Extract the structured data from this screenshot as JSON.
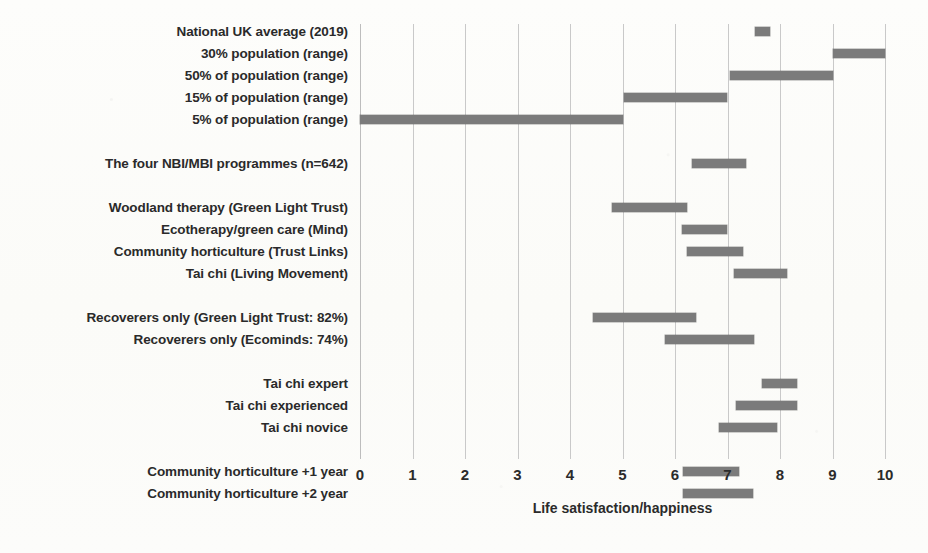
{
  "chart_data": {
    "type": "bar",
    "orientation": "horizontal",
    "style": "range-bars",
    "title": "",
    "xlabel": "Life satisfaction/happiness",
    "ylabel": "",
    "xlim": [
      0,
      10
    ],
    "xticks": [
      0,
      1,
      2,
      3,
      4,
      5,
      6,
      7,
      8,
      9,
      10
    ],
    "xtick_labels": [
      "0",
      "1",
      "2",
      "3",
      "4",
      "5",
      "6",
      "7",
      "8",
      "9",
      "10"
    ],
    "grid": "vertical",
    "legend": "none",
    "bar_color": "#7b7b7b",
    "gridline_color": "#c9c9c9",
    "background_color": "#fdfdfb",
    "groups": [
      {
        "name": "national-benchmarks",
        "rows": [
          {
            "label": "National UK average (2019)",
            "start": 7.52,
            "end": 7.81
          },
          {
            "label": "30% population (range)",
            "start": 9.0,
            "end": 10.0
          },
          {
            "label": "50% of population (range)",
            "start": 7.05,
            "end": 9.0
          },
          {
            "label": "15% of population (range)",
            "start": 5.03,
            "end": 7.0
          },
          {
            "label": "5% of population (range)",
            "start": 0.0,
            "end": 5.0
          }
        ]
      },
      {
        "name": "all-programmes",
        "rows": [
          {
            "label": "The four NBI/MBI programmes (n=642)",
            "start": 6.32,
            "end": 7.35
          }
        ]
      },
      {
        "name": "individual-programmes",
        "rows": [
          {
            "label": "Woodland therapy (Green Light Trust)",
            "start": 4.8,
            "end": 6.22
          },
          {
            "label": "Ecotherapy/green care (Mind)",
            "start": 6.13,
            "end": 7.0
          },
          {
            "label": "Community horticulture (Trust Links)",
            "start": 6.22,
            "end": 7.3
          },
          {
            "label": "Tai chi (Living Movement)",
            "start": 7.12,
            "end": 8.13
          }
        ]
      },
      {
        "name": "recoverers",
        "rows": [
          {
            "label": "Recoverers only (Green Light Trust: 82%)",
            "start": 4.43,
            "end": 6.4
          },
          {
            "label": "Recoverers only (Ecominds: 74%)",
            "start": 5.8,
            "end": 7.5
          }
        ]
      },
      {
        "name": "tai-chi-experience",
        "rows": [
          {
            "label": "Tai chi expert",
            "start": 7.65,
            "end": 8.32
          },
          {
            "label": "Tai chi experienced",
            "start": 7.16,
            "end": 8.32
          },
          {
            "label": "Tai chi novice",
            "start": 6.84,
            "end": 7.95
          }
        ]
      },
      {
        "name": "community-horticulture-followup",
        "rows": [
          {
            "label": "Community horticulture +1 year",
            "start": 6.15,
            "end": 7.22
          },
          {
            "label": "Community horticulture +2 year",
            "start": 6.15,
            "end": 7.49
          }
        ]
      }
    ]
  }
}
